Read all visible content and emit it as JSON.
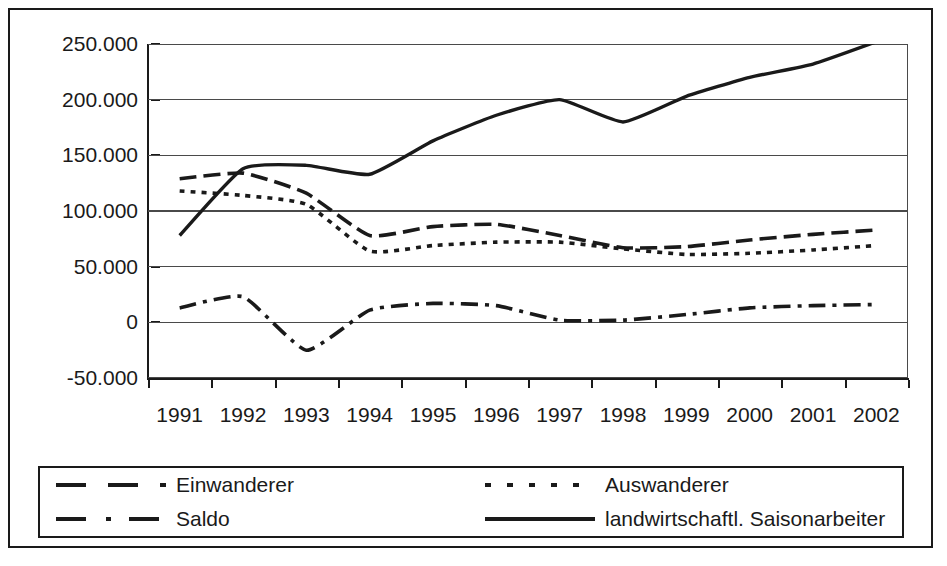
{
  "chart_data": {
    "type": "line",
    "title": "",
    "xlabel": "",
    "ylabel": "",
    "categories": [
      "1991",
      "1992",
      "1993",
      "1994",
      "1995",
      "1996",
      "1997",
      "1998",
      "1999",
      "2000",
      "2001",
      "2002"
    ],
    "ylim": [
      -50000,
      250000
    ],
    "ytick_values": [
      250000,
      200000,
      150000,
      100000,
      50000,
      0,
      -50000
    ],
    "ytick_labels": [
      "250.000",
      "200.000",
      "150.000",
      "100.000",
      "50.000",
      "0",
      "-50.000"
    ],
    "grid": true,
    "grid_axis": "y",
    "legend_position": "bottom",
    "series": [
      {
        "name": "Einwanderer",
        "style": "dashed",
        "color": "#1a1a1a",
        "values": [
          129000,
          134000,
          116000,
          78000,
          86000,
          88000,
          78000,
          67000,
          68000,
          74000,
          79000,
          83000
        ]
      },
      {
        "name": "Auswanderer",
        "style": "dotted",
        "color": "#1a1a1a",
        "values": [
          118000,
          114000,
          106000,
          64000,
          69000,
          72000,
          72000,
          66000,
          61000,
          62000,
          65000,
          69000
        ]
      },
      {
        "name": "Saldo",
        "style": "dash-dot",
        "color": "#1a1a1a",
        "values": [
          13000,
          23000,
          -25000,
          11000,
          17000,
          15000,
          2000,
          2000,
          7000,
          13000,
          15000,
          16000
        ]
      },
      {
        "name": "landwirtschaftl. Saisonarbeiter",
        "style": "solid",
        "color": "#1a1a1a",
        "values": [
          78000,
          138000,
          141000,
          133000,
          163000,
          186000,
          200000,
          180000,
          203000,
          220000,
          232000,
          252000
        ]
      }
    ]
  },
  "legend": {
    "entries": [
      {
        "label": "Einwanderer",
        "style": "dashed"
      },
      {
        "label": "Auswanderer",
        "style": "dotted"
      },
      {
        "label": "Saldo",
        "style": "dash-dot"
      },
      {
        "label": "landwirtschaftl. Saisonarbeiter",
        "style": "solid"
      }
    ]
  }
}
